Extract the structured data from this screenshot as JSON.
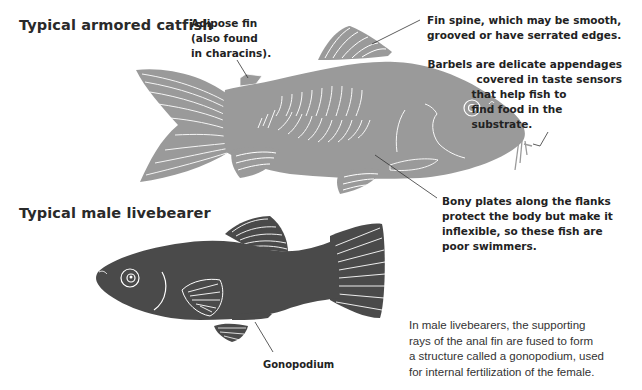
{
  "colors": {
    "catfish_body": "#9a9a9a",
    "livebearer_body": "#4a4a4a",
    "fin_rays": "#ffffff",
    "leader_lines": "#333333",
    "text": "#222222"
  },
  "sections": [
    {
      "title": "Typical armored catfish",
      "illustration": "armored-catfish",
      "annotations": [
        {
          "id": "adipose-fin",
          "lines": [
            "Adipose fin",
            "(also found",
            "in characins)."
          ]
        },
        {
          "id": "fin-spine",
          "lines": [
            "Fin spine, which may be smooth,",
            "grooved or have serrated edges."
          ]
        },
        {
          "id": "barbels",
          "lines": [
            "Barbels are delicate appendages",
            "covered in taste sensors",
            "that help fish to",
            "find food in the",
            "substrate."
          ]
        },
        {
          "id": "bony-plates",
          "lines": [
            "Bony plates along the flanks",
            "protect the body but make it",
            "inflexible, so these fish are",
            "poor swimmers."
          ]
        }
      ]
    },
    {
      "title": "Typical male livebearer",
      "illustration": "male-livebearer",
      "annotations": [
        {
          "id": "gonopodium",
          "lines": [
            "Gonopodium"
          ]
        }
      ],
      "caption": [
        "In male livebearers, the supporting",
        "rays of the anal fin are fused to form",
        "a structure called a gonopodium, used",
        "for internal fertilization of the female."
      ]
    }
  ]
}
